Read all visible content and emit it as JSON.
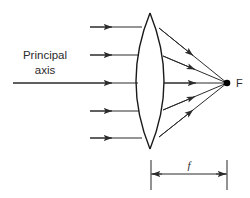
{
  "diagram": {
    "labels": {
      "axis_line1": "Principal",
      "axis_line2": "axis",
      "focus": "F",
      "focal_length": "f"
    },
    "colors": {
      "ray": "#2b2b2b",
      "lens": "#1a1a1a",
      "focus_dot": "#000000",
      "dimension": "#4a4a4a",
      "background": "#ffffff"
    },
    "geometry": {
      "lens": {
        "top_x": 150,
        "top_y": 13,
        "bottom_x": 150,
        "bottom_y": 149,
        "left_bulge_x": 136,
        "right_bulge_x": 164,
        "center_y": 81
      },
      "focus_point": {
        "x": 227,
        "y": 83
      },
      "incoming_rays": [
        {
          "y": 27,
          "x_start": 90,
          "x_end": 143
        },
        {
          "y": 55,
          "x_start": 90,
          "x_end": 140
        },
        {
          "y": 83,
          "x_start": 13,
          "x_end": 139
        },
        {
          "y": 111,
          "x_start": 90,
          "x_end": 140
        },
        {
          "y": 138,
          "x_start": 90,
          "x_end": 143
        }
      ],
      "refracted_rays": [
        {
          "x_start": 160,
          "y_start": 28,
          "x_end": 227,
          "y_end": 83
        },
        {
          "x_start": 163,
          "y_start": 56,
          "x_end": 227,
          "y_end": 83
        },
        {
          "x_start": 164,
          "y_start": 83,
          "x_end": 227,
          "y_end": 83
        },
        {
          "x_start": 163,
          "y_start": 110,
          "x_end": 227,
          "y_end": 83
        },
        {
          "x_start": 160,
          "y_start": 137,
          "x_end": 227,
          "y_end": 83
        }
      ],
      "dimension": {
        "y": 174,
        "left_x": 151,
        "right_x": 227,
        "tick_top": 160,
        "tick_bottom": 190
      },
      "axis_label_pos": {
        "x": 45,
        "y1": 59,
        "y2": 74
      },
      "focus_label_pos": {
        "x": 236,
        "y": 87
      },
      "focal_label_pos": {
        "x": 189,
        "y": 169
      }
    }
  }
}
